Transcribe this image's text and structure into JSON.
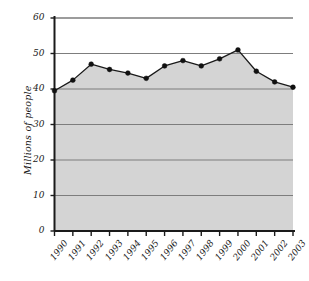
{
  "chart_data": {
    "type": "area",
    "title": "",
    "xlabel": "",
    "ylabel": "Millions of people",
    "categories": [
      "1990",
      "1991",
      "1992",
      "1993",
      "1994",
      "1995",
      "1996",
      "1997",
      "1998",
      "1999",
      "2000",
      "2001",
      "2002",
      "2003"
    ],
    "values": [
      39.5,
      42.5,
      47.0,
      45.5,
      44.5,
      43.0,
      46.5,
      48.0,
      46.5,
      48.5,
      51.0,
      45.0,
      42.0,
      40.5
    ],
    "series": [
      {
        "name": "Millions of people",
        "values": [
          39.5,
          42.5,
          47.0,
          45.5,
          44.5,
          43.0,
          46.5,
          48.0,
          46.5,
          48.5,
          51.0,
          45.0,
          42.0,
          40.5
        ]
      }
    ],
    "ylim": [
      0,
      60
    ],
    "ytick_labels": [
      "0",
      "10",
      "20",
      "30",
      "40",
      "50",
      "60"
    ],
    "ytick_values": [
      0,
      10,
      20,
      30,
      40,
      50,
      60
    ],
    "grid": true,
    "grid_axis": "y",
    "legend": "none",
    "marker": "filled-circle",
    "colors": {
      "area_fill": "#d4d4d4",
      "line": "#1a1a1a",
      "marker": "#111111",
      "gridline": "#7d7d7d",
      "axis": "#1a1a1a",
      "background": "#ffffff",
      "text": "#1a1a1a"
    }
  }
}
